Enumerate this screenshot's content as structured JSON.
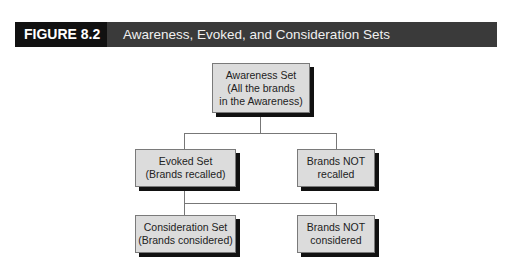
{
  "header": {
    "label": "FIGURE 8.2",
    "title": "Awareness, Evoked, and Consideration Sets",
    "label_bg": "#111111",
    "title_bg": "#3a3a3a"
  },
  "diagram": {
    "awareness": {
      "line1": "Awareness Set",
      "line2": "(All the brands",
      "line3": "in the Awareness)"
    },
    "evoked": {
      "line1": "Evoked Set",
      "line2": "(Brands recalled)"
    },
    "not_recalled": {
      "line1": "Brands NOT",
      "line2": "recalled"
    },
    "consideration": {
      "line1": "Consideration Set",
      "line2": "(Brands considered)"
    },
    "not_considered": {
      "line1": "Brands NOT",
      "line2": "considered"
    },
    "box_fill": "#dcdcdc",
    "shadow": "#111111"
  }
}
